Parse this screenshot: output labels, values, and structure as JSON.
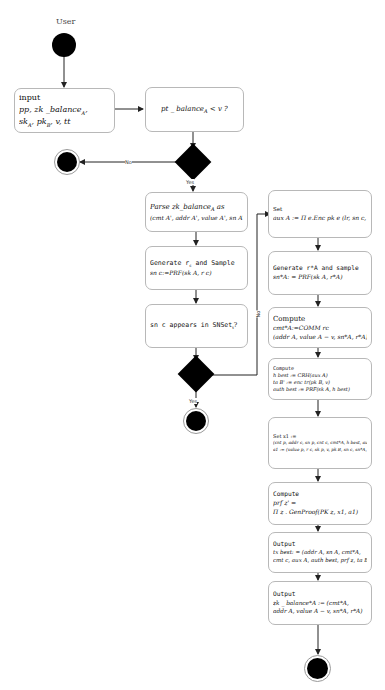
{
  "diagram": {
    "swimlane_label": "User",
    "decision_labels": {
      "balance_no": "No",
      "balance_yes": "Yes",
      "snset_no": "No",
      "snset_yes": "Yes"
    },
    "nodes": {
      "input": {
        "heading": "input",
        "line1": "pp, zk _balance",
        "line1_sub": "A",
        "line2": "sk",
        "line2_rest": "A, pk B, v, tt"
      },
      "balance_check": {
        "text": "pt _ balance",
        "sub": "A",
        "rest": " < v ?"
      },
      "parse": {
        "line1": "Parse zk_balance",
        "line1_sub": "A",
        "line1_rest": " as",
        "line2": "(cmt A', addr A', value A', sn A', r A')"
      },
      "generate_r": {
        "line1": "Generate r",
        "line1_sub": "c",
        "line1_rest": " and Sample",
        "line2": "sn c:=PRF(sk A, r c)"
      },
      "sn_check": {
        "text": "sn c appears in SNSet",
        "sub": "t",
        "rest": "?"
      },
      "set_aux": {
        "heading": "Set",
        "line1": "aux A := Π e.Enc pk e (lr, sn c, r, sn A)"
      },
      "generate_r_star": {
        "line1": "Generate  r*A  and sample",
        "line2": "sn*A: = PRF(sk A, r*A)"
      },
      "compute_cmt": {
        "heading": "Compute",
        "line1": "cmt*A:=COMM rc",
        "line2": "(addr A, value A − v, sn*A, r*A)"
      },
      "compute_h": {
        "heading": "Compute",
        "line1": "h best := CRH(aux A)",
        "line2": "ta B' := enc tr(pk B, v)",
        "line3": "auth best := PRF(sk A, h best)"
      },
      "set_x": {
        "heading": "Set x1 :=",
        "line1": "(cnt p, addr c, sn p, cnt c, cmt*A, h best, auth best)",
        "line2": "a1 := (value p, r c, sk p, v, pk B, sn c, sn*A, r*A)"
      },
      "compute_prf": {
        "heading": "Compute",
        "line1": "prf z' =",
        "line2": "Π z . GenProof(PK z, x1, a1)"
      },
      "output_tx": {
        "heading": "Output",
        "line1": "tx best: = (addr A, sn A, cmt*A,",
        "line2": "cmt c, aux A, auth best, prf z, ta B)"
      },
      "output_balance": {
        "heading": "Output",
        "line1": "zk _ balance*A := (cmt*A,",
        "line2": "addr A, value A − v, sn*A, r*A)"
      }
    }
  }
}
